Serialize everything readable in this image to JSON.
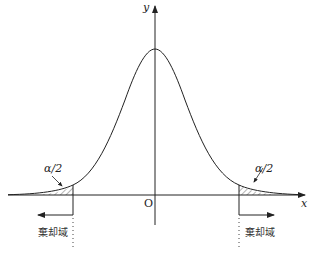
{
  "diagram": {
    "type": "normal-distribution-two-tailed-test",
    "axes": {
      "x_label": "x",
      "y_label": "y",
      "origin_label": "O"
    },
    "tails": {
      "left": {
        "area_label": "α/2",
        "region_label": "棄却域",
        "arrow_direction": "left"
      },
      "right": {
        "area_label": "α/2",
        "region_label": "棄却域",
        "arrow_direction": "right"
      }
    },
    "colors": {
      "stroke": "#222222",
      "hatch": "#444444",
      "background": "#ffffff"
    }
  }
}
